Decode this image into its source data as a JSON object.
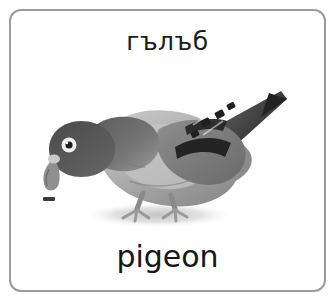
{
  "card": {
    "word_top": "гълъб",
    "word_bottom": "pigeon",
    "border_color": "#9b9b9b",
    "background_color": "#ffffff",
    "text_color": "#1c1c1c"
  },
  "illustration": {
    "subject": "pigeon",
    "alt": "grayscale photo of a pigeon bending down pecking at a seed on the ground",
    "palette": {
      "head": "#595959",
      "neck": "#6e6e6e",
      "body_light": "#b4b4b4",
      "body_mid": "#9c9c9c",
      "wing_dark": "#2e2e2e",
      "wing_mid": "#7a7a7a",
      "tail": "#4f4f4f",
      "beak": "#8f8f8f",
      "legs": "#8a8a8a",
      "eye_ring": "#efefef",
      "pupil": "#202020",
      "shadow": "#d4d4d4",
      "seed": "#3a3a3a"
    }
  }
}
